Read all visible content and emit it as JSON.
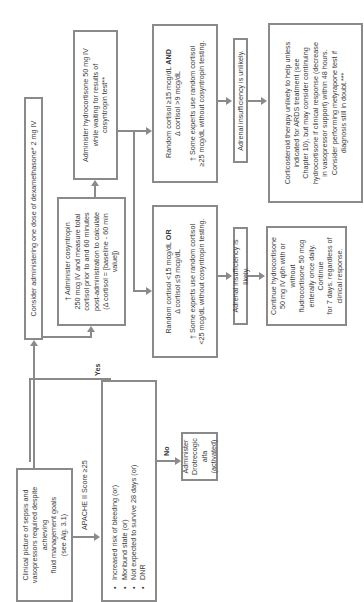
{
  "diagram": {
    "orientation": "rotated-90-ccw",
    "clinical_box": {
      "lines": [
        "Clinical picture of sepsis and",
        "vasopressors required despite achieving",
        "fluid management goals",
        "(see Alg. 3.1)"
      ]
    },
    "apache_label": "APACHE II Score ≥25",
    "criteria_box": {
      "items": [
        "Increased risk of bleeding (or)",
        "Moribund state (or)",
        "Not expected to survive 28 days (or)",
        "DNR"
      ]
    },
    "yes_label": "Yes",
    "no_label": "No",
    "drotrecogin_box": {
      "lines": [
        "Administer",
        "Drotrecogic alfa",
        "(activated)"
      ]
    },
    "dexamethasone_box": {
      "text": "Consider administering one dose of dexamethasone* 2 mg IV"
    },
    "cosyntropin_box": {
      "lines": [
        "† Administer cosyntropin",
        "250 mcg IV and measure total",
        "cortisol prior to and 60 minutes",
        "post-administration to calculate",
        "(Δ cortisol = [baseline - 60 min value])"
      ]
    },
    "hydrocortisone_box": {
      "lines": [
        "Administer hydrocortisone 50 mg IV",
        "while waiting for results of",
        "cosyntropin test**"
      ]
    },
    "random_high_box": {
      "line1": "Random cortisol ≥15 mcg/dL ",
      "line1_bold": "AND",
      "line2": "Δ cortisol >9 mcg/dL",
      "note1": "† Some experts use random cortisol",
      "note2": "≥25 mcg/dL without cosyntropin testing."
    },
    "random_low_box": {
      "line1": "Random cortisol <15 mcg/dL ",
      "line1_bold": "OR",
      "line2": "Δ cortisol ≤9 mcg/dL",
      "note1": "† Some experts use random cortisol",
      "note2": "<25 mcg/dL without cosyntropin testing."
    },
    "unlikely_box": {
      "text": "Adrenal insufficiency is unlikely."
    },
    "likely_box": {
      "text": "Adrenal insufficiency is likely."
    },
    "corticosteroid_box": {
      "lines": [
        "Corticosteroid therapy unlikely to help unless",
        "indicated for ARDS treatment (see",
        "Chapter 10), but may consider continuing",
        "hydrocortisone if clinical response (decrease",
        "in vasopressor support) within 48 hours.",
        "Consider performing metyrapone test if",
        "diagnosis still in doubt.***"
      ]
    },
    "continue_box": {
      "lines": [
        "Continue hydrocortisone",
        "50 mg IV q6h with or without",
        "fludrocortisone 50 mcg",
        "enterally once daily. Continue",
        "for 7 days, regardless of",
        "clinical response."
      ]
    },
    "colors": {
      "border": "#8a8a8a",
      "text": "#3a3a3a",
      "background": "#ffffff"
    }
  }
}
